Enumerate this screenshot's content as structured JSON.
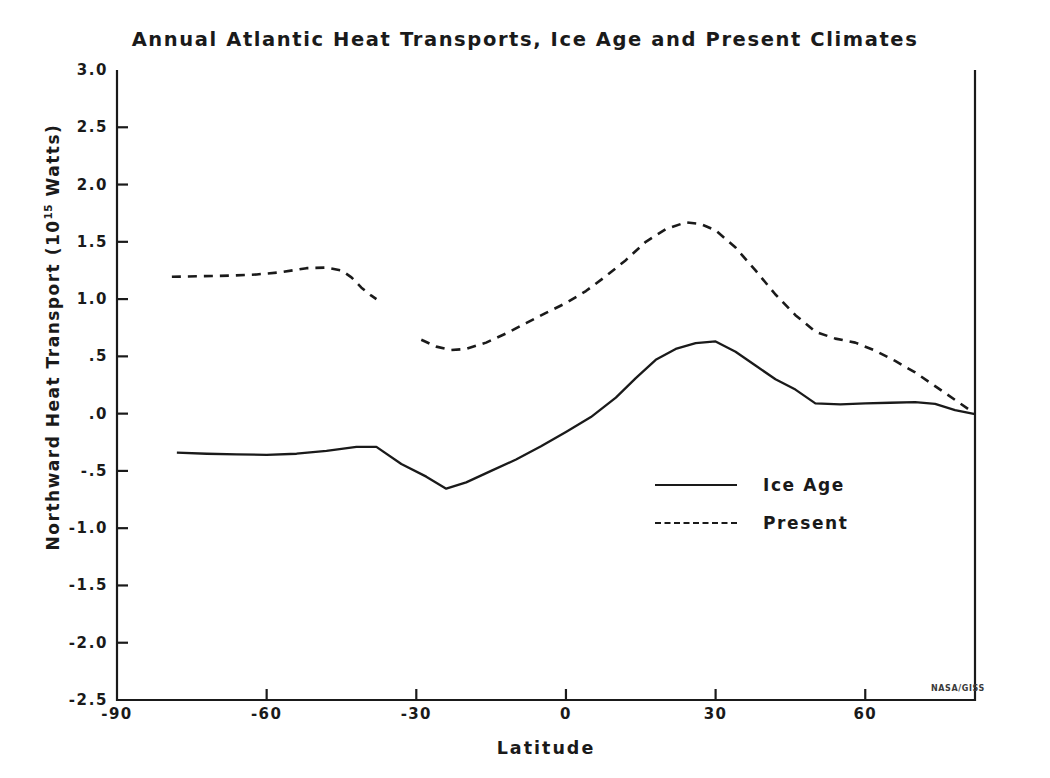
{
  "chart_data": {
    "type": "line",
    "title": "Annual Atlantic Heat Transports, Ice Age and Present Climates",
    "xlabel": "Latitude",
    "ylabel_text": "Northward Heat Transport (10",
    "ylabel_sup": "15",
    "ylabel_tail": " Watts)",
    "ylabel_full": "Northward Heat Transport (10^15 Watts)",
    "xlim": [
      -90,
      82
    ],
    "ylim": [
      -2.5,
      3.0
    ],
    "grid": false,
    "legend_position": "center-right",
    "xticks": [
      -90,
      -60,
      -30,
      0,
      30,
      60
    ],
    "xtick_labels": [
      "-90",
      "-60",
      "-30",
      "0",
      "30",
      "60"
    ],
    "yticks": [
      3.0,
      2.5,
      2.0,
      1.5,
      1.0,
      0.5,
      0.0,
      -0.5,
      -1.0,
      -1.5,
      -2.0,
      -2.5
    ],
    "ytick_labels": [
      "3.0",
      "2.5",
      "2.0",
      "1.5",
      "1.0",
      ".5",
      ".0",
      "-.5",
      "-1.0",
      "-1.5",
      "-2.0",
      "-2.5"
    ],
    "credit": "NASA/GISS",
    "series": [
      {
        "name": "Ice Age",
        "style": "solid",
        "color": "#1a1a1a",
        "x": [
          -78,
          -72,
          -66,
          -60,
          -54,
          -48,
          -42,
          -38,
          -33,
          -28,
          -24,
          -20,
          -15,
          -10,
          -5,
          0,
          5,
          10,
          14,
          18,
          22,
          26,
          30,
          34,
          38,
          42,
          46,
          50,
          55,
          60,
          65,
          70,
          74,
          78,
          82
        ],
        "values": [
          -0.34,
          -0.35,
          -0.355,
          -0.36,
          -0.35,
          -0.325,
          -0.29,
          -0.29,
          -0.44,
          -0.55,
          -0.655,
          -0.6,
          -0.5,
          -0.4,
          -0.285,
          -0.16,
          -0.03,
          0.14,
          0.31,
          0.47,
          0.565,
          0.615,
          0.63,
          0.54,
          0.42,
          0.3,
          0.21,
          0.09,
          0.08,
          0.09,
          0.095,
          0.1,
          0.085,
          0.03,
          -0.005
        ]
      },
      {
        "name": "Present",
        "style": "dashed",
        "color": "#1a1a1a",
        "segments": [
          {
            "x": [
              -79,
              -73,
              -67,
              -62,
              -57,
              -52,
              -48,
              -45,
              -43,
              -41,
              -39,
              -38
            ],
            "values": [
              1.195,
              1.2,
              1.205,
              1.215,
              1.235,
              1.27,
              1.275,
              1.25,
              1.19,
              1.1,
              1.03,
              1.0
            ]
          },
          {
            "x": [
              -29,
              -26,
              -23,
              -20,
              -16,
              -12,
              -8,
              -4,
              0,
              4,
              8,
              12,
              16,
              20,
              24,
              27,
              30,
              34,
              38,
              42,
              46,
              50,
              54,
              58,
              62,
              66,
              70,
              74,
              78,
              82
            ],
            "values": [
              0.645,
              0.585,
              0.555,
              0.565,
              0.62,
              0.7,
              0.79,
              0.88,
              0.965,
              1.07,
              1.2,
              1.34,
              1.5,
              1.61,
              1.67,
              1.655,
              1.6,
              1.45,
              1.25,
              1.04,
              0.86,
              0.715,
              0.655,
              0.62,
              0.55,
              0.46,
              0.36,
              0.24,
              0.12,
              0.0
            ]
          }
        ]
      }
    ]
  },
  "legend": {
    "items": [
      {
        "label": "Ice Age",
        "style": "solid"
      },
      {
        "label": "Present",
        "style": "dashed"
      }
    ]
  }
}
